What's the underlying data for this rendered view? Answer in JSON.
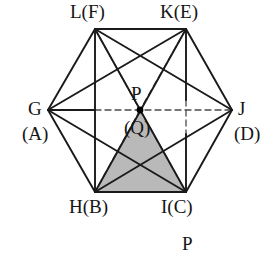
{
  "figure": {
    "canvas": {
      "width": 275,
      "height": 256
    },
    "colors": {
      "stroke": "#1a1a1a",
      "dashed_stroke": "#4a4a4a",
      "shade_fill": "#b9b9b9",
      "background": "#ffffff",
      "point_fill": "#000000"
    },
    "stroke_widths": {
      "solid": 1.9,
      "dashed": 1.3
    },
    "dash_pattern": "6,4"
  },
  "vertices": [
    {
      "id": "L",
      "label": "L(F)",
      "x": 95,
      "y": 29,
      "label_x": 70,
      "label_y": 2
    },
    {
      "id": "K",
      "label": "K(E)",
      "x": 186,
      "y": 29,
      "label_x": 160,
      "label_y": 2
    },
    {
      "id": "J",
      "label": "J",
      "x": 232,
      "y": 110,
      "label_x": 238,
      "label_y": 99
    },
    {
      "id": "I",
      "label": "I(C)",
      "x": 186,
      "y": 192,
      "label_x": 161,
      "label_y": 197
    },
    {
      "id": "H",
      "label": "H(B)",
      "x": 95,
      "y": 192,
      "label_x": 69,
      "label_y": 197
    },
    {
      "id": "G",
      "label": "G",
      "x": 48,
      "y": 110,
      "label_x": 28,
      "label_y": 99
    }
  ],
  "secondary_labels": [
    {
      "id": "A",
      "label": "(A)",
      "x": 22,
      "y": 124
    },
    {
      "id": "D",
      "label": "(D)",
      "x": 234,
      "y": 124
    }
  ],
  "center_point": {
    "id": "P",
    "x": 140,
    "y": 110,
    "radius": 3.4,
    "label_top": "P",
    "label_top_x": 131,
    "label_top_y": 84,
    "label_bottom": "(Q)",
    "label_bottom_x": 124,
    "label_bottom_y": 118
  },
  "bottom_caption": {
    "text": "P",
    "x": 182,
    "y": 234
  },
  "hexagon_edges": [
    {
      "from": "L",
      "to": "K"
    },
    {
      "from": "K",
      "to": "J"
    },
    {
      "from": "J",
      "to": "I"
    },
    {
      "from": "I",
      "to": "H"
    },
    {
      "from": "H",
      "to": "G"
    },
    {
      "from": "G",
      "to": "L"
    }
  ],
  "solid_segments": [
    {
      "name": "square-left-side",
      "from": "L",
      "to": "H"
    },
    {
      "name": "diagonal-L-J",
      "from": "L",
      "to": "J"
    },
    {
      "name": "diagonal-L-I",
      "from": "L",
      "to": "I"
    },
    {
      "name": "diagonal-K-G",
      "from": "K",
      "to": "G"
    },
    {
      "name": "diagonal-K-H",
      "from": "K",
      "to": "H"
    },
    {
      "name": "diagonal-G-I",
      "from": "G",
      "to": "I"
    },
    {
      "name": "diagonal-H-J",
      "from": "H",
      "to": "J"
    },
    {
      "name": "square-right-upper",
      "from": "K",
      "to": "MIDK"
    },
    {
      "name": "square-right-lower",
      "from": "MIDI",
      "to": "I"
    },
    {
      "name": "axis-G-left",
      "from": "G",
      "to": "AXL"
    }
  ],
  "dashed_segments": [
    {
      "name": "dashed-L-P",
      "from": "L",
      "to": "P"
    },
    {
      "name": "dashed-P-I",
      "from": "P",
      "to": "I"
    },
    {
      "name": "dashed-K-P",
      "from": "K",
      "to": "P"
    },
    {
      "name": "dashed-P-H",
      "from": "P",
      "to": "H"
    },
    {
      "name": "dashed-axis-right",
      "from": "AXL",
      "to": "J"
    },
    {
      "name": "dashed-vert-mid",
      "from": "MIDK",
      "to": "MIDI"
    }
  ],
  "shaded_triangle": {
    "name": "triangle-P-H-I",
    "points": "140,110 95,192 186,192",
    "fill": "#b9b9b9"
  },
  "helper_points": {
    "MIDK": {
      "x": 186,
      "y": 100
    },
    "MIDI": {
      "x": 186,
      "y": 134
    },
    "AXL": {
      "x": 95,
      "y": 110
    }
  }
}
